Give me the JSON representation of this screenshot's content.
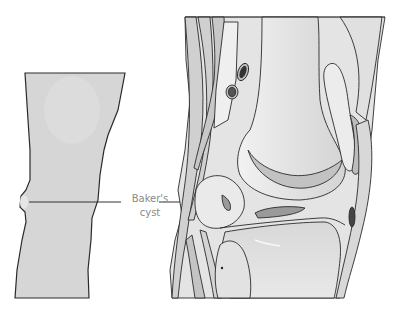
{
  "figure": {
    "title": "Baker's cyst",
    "label": {
      "line1": "Baker's",
      "line2": "cyst"
    },
    "panels": [
      {
        "name": "leg-exterior-view",
        "description": "Back of leg silhouette showing bulge behind knee"
      },
      {
        "name": "knee-cross-section",
        "description": "Sagittal anatomical cross-section of knee joint"
      }
    ]
  },
  "colors": {
    "skin": "#d6d6d6",
    "outline": "#2a2a2a",
    "bone": "#ececec",
    "bone_shade": "#bdbdbd",
    "muscle": "#cfcfcf",
    "label_text": "#8a8a8a",
    "leader_line": "#333333",
    "background": "#ffffff"
  }
}
